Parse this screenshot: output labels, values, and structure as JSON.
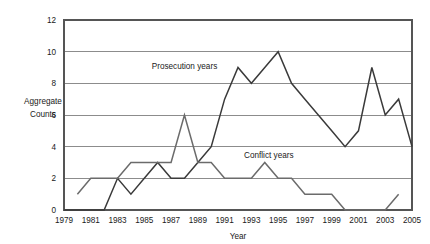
{
  "chart_data": {
    "type": "line",
    "title": "",
    "xlabel": "Year",
    "ylabel": "Aggregate Counts",
    "ylabel_line1": "Aggregate",
    "ylabel_line2": "Counts",
    "xlim": [
      1979,
      2005
    ],
    "ylim": [
      0,
      12
    ],
    "y_ticks": [
      0,
      2,
      4,
      6,
      8,
      10,
      12
    ],
    "x_ticks": [
      1979,
      1981,
      1983,
      1985,
      1987,
      1989,
      1991,
      1993,
      1995,
      1997,
      1999,
      2001,
      2003,
      2005
    ],
    "x": [
      1979,
      1980,
      1981,
      1982,
      1983,
      1984,
      1985,
      1986,
      1987,
      1988,
      1989,
      1990,
      1991,
      1992,
      1993,
      1994,
      1995,
      1996,
      1997,
      1998,
      1999,
      2000,
      2001,
      2002,
      2003,
      2004,
      2005
    ],
    "grid": "horizontal",
    "legend_position": "inline-annotation",
    "series": [
      {
        "name": "Prosecution years",
        "color": "#3a3a3a",
        "label_x": 1988.0,
        "label_y": 8.9,
        "values": [
          0,
          0,
          0,
          0,
          2,
          1,
          2,
          3,
          2,
          2,
          3,
          4,
          7,
          9,
          8,
          9,
          10,
          8,
          7,
          6,
          5,
          4,
          5,
          9,
          6,
          7,
          4
        ]
      },
      {
        "name": "Conflict years",
        "color": "#6b6b6b",
        "label_x": 1994.3,
        "label_y": 3.3,
        "values": [
          null,
          1,
          2,
          2,
          2,
          3,
          3,
          3,
          3,
          6,
          3,
          3,
          2,
          2,
          2,
          3,
          2,
          2,
          1,
          1,
          1,
          0,
          0,
          0,
          0,
          1,
          null
        ]
      }
    ]
  }
}
